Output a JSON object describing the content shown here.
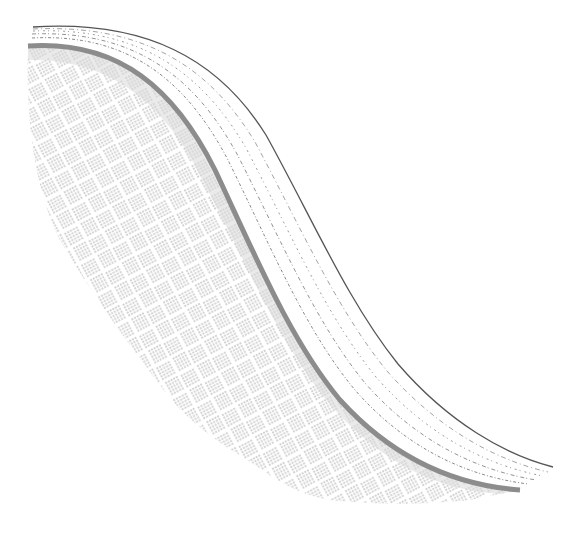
{
  "artwork": {
    "background": "#ffffff",
    "description": "Abstract drawing: S-shaped band of parallel dashed lines above a woven basket-weave hatch field",
    "colors": {
      "top_line": "#555555",
      "dash_lines": "#8a8a8a",
      "thick_edge": "#8c8c8c",
      "hatch": "#a9a9a9",
      "hatch_light": "#c4c4c4"
    },
    "curves": {
      "top_line": {
        "start": [
          33,
          27
        ],
        "end": [
          553,
          467
        ]
      },
      "thick_edge": {
        "start": [
          28,
          46
        ],
        "end": [
          520,
          490
        ]
      },
      "dashed_count": 6
    }
  }
}
